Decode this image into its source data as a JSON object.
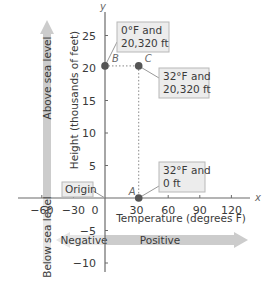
{
  "chart_data": {
    "type": "scatter",
    "title": "",
    "xlabel": "Temperature (degrees F)",
    "ylabel": "Height (thousands of feet)",
    "x_axis_symbol": "x",
    "y_axis_symbol": "y",
    "xlim": [
      -70,
      135
    ],
    "ylim": [
      -12,
      28
    ],
    "x_ticks": [
      -60,
      -30,
      0,
      30,
      60,
      90,
      120
    ],
    "x_tick_labels": [
      "−60",
      "−30",
      "0",
      "30",
      "60",
      "90",
      "120"
    ],
    "y_ticks": [
      -10,
      -5,
      5,
      10,
      15,
      20,
      25
    ],
    "y_tick_labels": [
      "−10",
      "−5",
      "5",
      "10",
      "15",
      "20",
      "25"
    ],
    "grid": false,
    "points": [
      {
        "name": "A",
        "x": 32,
        "y": 0,
        "label": [
          "32°F and",
          "0 ft"
        ]
      },
      {
        "name": "B",
        "x": 0,
        "y": 20.32,
        "label": [
          "0°F and",
          "20,320 ft"
        ]
      },
      {
        "name": "C",
        "x": 32,
        "y": 20.32,
        "label": [
          "32°F and",
          "20,320 ft"
        ]
      }
    ],
    "origin_label": "Origin",
    "annotations": {
      "vertical_arrow_up": "Above sea level",
      "vertical_arrow_down": "Below sea level",
      "horizontal_arrow_left": "Negative",
      "horizontal_arrow_right": "Positive"
    },
    "dashed_guides": [
      {
        "from": "B",
        "to": "C"
      },
      {
        "from": "C",
        "to": "A"
      }
    ]
  },
  "colors": {
    "axis": "#6b6b6b",
    "point": "#555555",
    "box_fill": "#ececec",
    "box_stroke": "#b8b8b8",
    "arrow_light": "#e6e6e6",
    "arrow_dark": "#cccccc",
    "text": "#3a3a3a"
  }
}
